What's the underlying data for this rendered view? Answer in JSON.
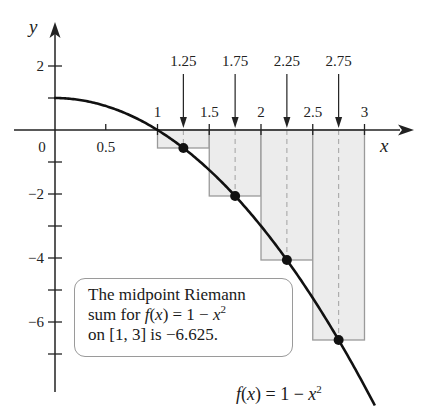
{
  "chart_data": {
    "type": "line",
    "title": "",
    "xlabel": "x",
    "ylabel": "y",
    "function": "f(x) = 1 - x^2",
    "curve_domain": [
      0,
      3.1
    ],
    "xlim": [
      -0.15,
      3.35
    ],
    "ylim": [
      -7.7,
      3.3
    ],
    "x_ticks": [
      0.5,
      1,
      1.5,
      2,
      2.5,
      3
    ],
    "x_tick_labels": [
      "0.5",
      "1",
      "1.5",
      "2",
      "2.5",
      "3"
    ],
    "origin_label": "0",
    "y_ticks": [
      2,
      1,
      -1,
      -2,
      -3,
      -4,
      -5,
      -6,
      -7
    ],
    "y_tick_labels": [
      {
        "y": 2,
        "label": "2"
      },
      {
        "y": -2,
        "label": "−2"
      },
      {
        "y": -4,
        "label": "−4"
      },
      {
        "y": -6,
        "label": "−6"
      }
    ],
    "grid": false,
    "riemann_sum": {
      "method": "midpoint",
      "interval": [
        1,
        3
      ],
      "n": 4,
      "dx": 0.5,
      "rectangles": [
        {
          "x0": 1.0,
          "x1": 1.5,
          "midpoint": 1.25,
          "height": -0.5625
        },
        {
          "x0": 1.5,
          "x1": 2.0,
          "midpoint": 1.75,
          "height": -2.0625
        },
        {
          "x0": 2.0,
          "x1": 2.5,
          "midpoint": 2.25,
          "height": -4.0625
        },
        {
          "x0": 2.5,
          "x1": 3.0,
          "midpoint": 2.75,
          "height": -6.5625
        }
      ],
      "sum": -6.625
    },
    "midpoint_labels": [
      "1.25",
      "1.75",
      "2.25",
      "2.75"
    ],
    "annotations": [
      "The midpoint Riemann sum for f(x) = 1 − x² on [1, 3] is −6.625.",
      "f(x) = 1 − x²"
    ]
  },
  "note": {
    "line1": "The midpoint Riemann",
    "line2_a": "sum for ",
    "line2_f": "f",
    "line2_b": "(",
    "line2_x": "x",
    "line2_c": ") = 1 − ",
    "line2_x2": "x",
    "line2_exp": "2",
    "line3": "on [1, 3] is −6.625."
  },
  "curve_label": {
    "f": "f",
    "open": "(",
    "x": "x",
    "mid": ") = 1 − ",
    "x2": "x",
    "exp": "2"
  },
  "colors": {
    "curve": "#111111",
    "axis": "#222222",
    "rect_fill": "#ececec",
    "rect_stroke": "#9a9a9a",
    "dashed": "#a8a8a8",
    "point": "#111111"
  }
}
